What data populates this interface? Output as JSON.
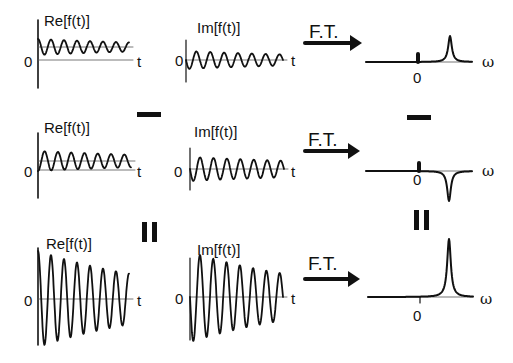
{
  "labels": {
    "re": "Re[f(t)]",
    "im": "Im[f(t)]",
    "ft": "F.T.",
    "t": "t",
    "zero": "0",
    "omega": "ω"
  },
  "operators": {
    "minus": "minus",
    "equals": "equals"
  },
  "rows": [
    {
      "re": {
        "label": "Re[f(t)]",
        "origin": [
          38,
          37
        ],
        "axis_y": 60,
        "axis_len": 120,
        "offset": 14,
        "amp": 8,
        "decay": 0.006,
        "cycles": 7,
        "start_phase": "peak"
      },
      "im": {
        "label": "Im[f(t)]",
        "origin": [
          186,
          57
        ],
        "amp": 9,
        "decay": 0.005,
        "cycles": 7
      },
      "ft": {
        "label": "F.T.",
        "peak": "positive",
        "peak_x": 450,
        "peak_h": 26,
        "offset_bar_x": 418
      },
      "operator_after": "minus"
    },
    {
      "re": {
        "label": "Re[f(t)]",
        "origin": [
          38,
          155
        ],
        "axis_y": 170,
        "axis_len": 120,
        "offset": 12,
        "amp": 10,
        "decay": 0.005,
        "cycles": 7,
        "start_phase": "trough"
      },
      "im": {
        "label": "Im[f(t)]",
        "origin": [
          190,
          168
        ],
        "amp": 12,
        "decay": 0.004,
        "cycles": 7
      },
      "ft": {
        "label": "F.T.",
        "peak": "negative",
        "peak_x": 449,
        "peak_h": 30,
        "offset_bar_x": 419
      },
      "operator_after": "equals"
    },
    {
      "re": {
        "label": "Re[f(t)]",
        "origin": [
          38,
          299
        ],
        "axis_y": 299,
        "axis_len": 120,
        "offset": 0,
        "amp": 48,
        "decay": 0.007,
        "cycles": 7,
        "start_phase": "peak"
      },
      "im": {
        "label": "Im[f(t)]",
        "origin": [
          190,
          297
        ],
        "amp": 45,
        "decay": 0.007,
        "cycles": 7
      },
      "ft": {
        "label": "F.T.",
        "peak": "positive",
        "peak_x": 449,
        "peak_h": 58,
        "offset_bar_x": 420
      },
      "operator_after": null
    }
  ]
}
